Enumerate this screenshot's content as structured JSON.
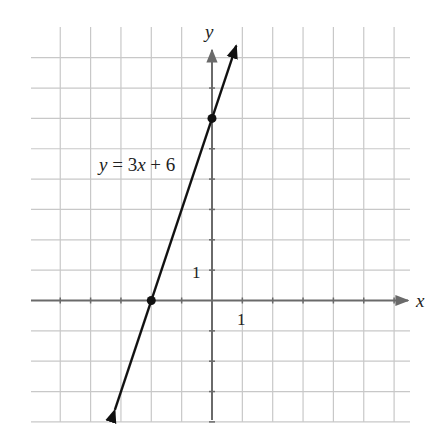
{
  "chart_data": {
    "type": "line",
    "title": "",
    "xlabel": "x",
    "ylabel": "y",
    "equation_label": "y = 3x + 6",
    "equation_parts": {
      "y": "y",
      "eq": " = 3",
      "x": "x",
      "rest": " + 6"
    },
    "x_tick_label": "1",
    "y_tick_label": "1",
    "xlim": [
      -6,
      6
    ],
    "ylim": [
      -4,
      8
    ],
    "grid": true,
    "series": [
      {
        "name": "y = 3x + 6",
        "slope": 3,
        "intercept": 6,
        "x": [
          -3.2,
          -2,
          0,
          0.8
        ],
        "y": [
          -3.6,
          0,
          6,
          8.4
        ]
      }
    ],
    "points": [
      {
        "x": -2,
        "y": 0,
        "label": "x-intercept"
      },
      {
        "x": 0,
        "y": 6,
        "label": "y-intercept"
      }
    ],
    "colors": {
      "grid": "#c8c8c8",
      "axis": "#6a6a6a",
      "line": "#111111"
    }
  }
}
